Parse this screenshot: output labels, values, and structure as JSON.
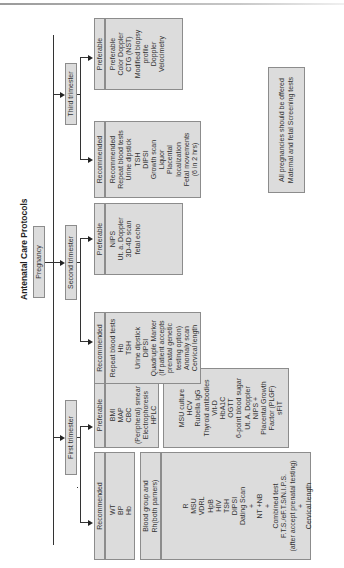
{
  "title": "Antenatal Care Protocols",
  "root": "Pregnancy",
  "note": {
    "lines": [
      "All pregnancies should be offered",
      "Maternal and fetal Screening tests"
    ]
  },
  "trimesters": [
    {
      "label": "First trimester",
      "recommended": {
        "header": "Recommended",
        "items": [
          "WT",
          "BP",
          "Hb"
        ]
      },
      "preferable": {
        "header": "Preferable",
        "items": [
          "BMI",
          "MAP",
          "CBC",
          "(Peripheral) smear",
          "Electrophoresis",
          "HPLC"
        ]
      },
      "blood_group": {
        "header_lines": [
          "Blood group and",
          "Rh(both parners)"
        ],
        "items": [
          "R",
          "MSU",
          "VDRL",
          "HpB",
          "HIV",
          "TSH",
          "DIPSI",
          "Dating Scan",
          "+",
          "NT +NB",
          "+",
          "Combined test",
          "F.T.S./eF.T.S/N.I.P.S.",
          "(after accept prenatal testing)",
          "+",
          "Cervical length"
        ]
      },
      "additional": {
        "items": [
          "MSU culture",
          "HCV",
          "Rubella IgG",
          "Thyroid antibodies",
          "Vit-D",
          "HbA1C",
          "OGTT",
          "6-point blood sugar",
          "Ut. A. Doppler",
          "NIPS +",
          "Placental Growth",
          "Factor (PLGF)",
          "sFIT"
        ]
      }
    },
    {
      "label": "Second trimester",
      "recommended": {
        "header": "Recommended",
        "items": [
          "Repeat blood tests",
          "Hb",
          "TSH",
          "Urine dipstick",
          "DIPSI",
          "Quadruple Marker",
          "(If patient accepts",
          "prenatal genetic",
          "testing option)",
          "Anomaly scan",
          "Cervical length"
        ]
      },
      "preferable": {
        "header": "Preferable",
        "items": [
          "NIPS",
          "Ut. a. Doppler",
          "3D-4D scan",
          "fetal echo"
        ]
      }
    },
    {
      "label": "Third trimester",
      "recommended": {
        "header": "Recommended",
        "items": [
          "Recommended",
          "Repeat blood tests",
          "Urine dipstick",
          "TSH",
          "DIPSI",
          "Growth scan",
          "Liquor",
          "Placental",
          "localization",
          "Fetal movements",
          "(6 in 2 hrs)"
        ]
      },
      "preferable": {
        "header": "Preferable",
        "items": [
          "Preferable",
          "Color Doppler",
          "CTG (NST)",
          "Modified biopsy",
          "profile",
          "Doppler",
          "Velocimetry"
        ]
      }
    }
  ],
  "colors": {
    "box_fill": "#dcdcdc",
    "box_border": "#8c8c8c",
    "line": "#333333",
    "text": "#333333"
  }
}
